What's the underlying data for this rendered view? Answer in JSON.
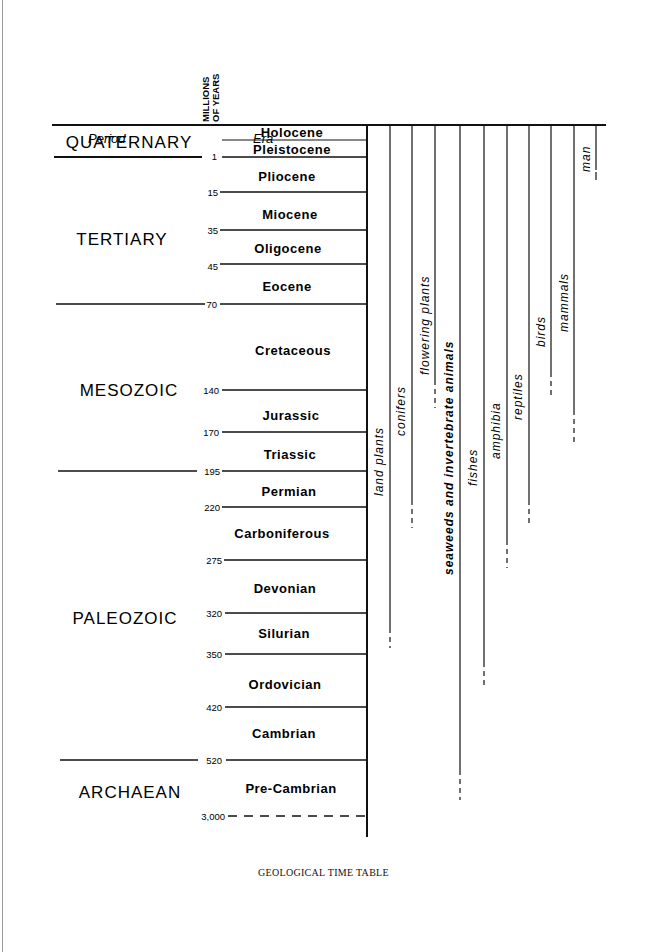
{
  "header": {
    "period_label": "Period",
    "years_label_line1": "MILLIONS",
    "years_label_line2": "OF YEARS",
    "era_label": "Era"
  },
  "periods": [
    {
      "name": "QUATERNARY"
    },
    {
      "name": "TERTIARY"
    },
    {
      "name": "MESOZOIC"
    },
    {
      "name": "PALEOZOIC"
    },
    {
      "name": "ARCHAEAN"
    }
  ],
  "eras": [
    {
      "name": "Holocene"
    },
    {
      "name": "Pleistocene",
      "end_mya": "1"
    },
    {
      "name": "Pliocene",
      "end_mya": "15"
    },
    {
      "name": "Miocene",
      "end_mya": "35"
    },
    {
      "name": "Oligocene",
      "end_mya": "45"
    },
    {
      "name": "Eocene",
      "end_mya": "70"
    },
    {
      "name": "Cretaceous",
      "end_mya": "140"
    },
    {
      "name": "Jurassic",
      "end_mya": "170"
    },
    {
      "name": "Triassic",
      "end_mya": "195"
    },
    {
      "name": "Permian",
      "end_mya": "220"
    },
    {
      "name": "Carboniferous",
      "end_mya": "275"
    },
    {
      "name": "Devonian",
      "end_mya": "320"
    },
    {
      "name": "Silurian",
      "end_mya": "350"
    },
    {
      "name": "Ordovician",
      "end_mya": "420"
    },
    {
      "name": "Cambrian",
      "end_mya": "520"
    },
    {
      "name": "Pre-Cambrian",
      "end_mya": "3,000"
    }
  ],
  "life_forms": [
    {
      "name": "land plants"
    },
    {
      "name": "conifers"
    },
    {
      "name": "flowering plants"
    },
    {
      "name": "seaweeds and invertebrate animals"
    },
    {
      "name": "fishes"
    },
    {
      "name": "amphibia"
    },
    {
      "name": "reptiles"
    },
    {
      "name": "birds"
    },
    {
      "name": "mammals"
    },
    {
      "name": "man"
    }
  ],
  "caption": "GEOLOGICAL TIME TABLE"
}
